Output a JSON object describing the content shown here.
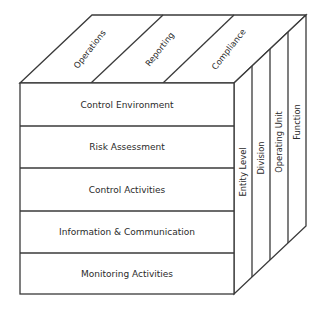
{
  "diagram": {
    "top_face": {
      "objectives": [
        {
          "label": "Operations"
        },
        {
          "label": "Reporting"
        },
        {
          "label": "Compliance"
        }
      ]
    },
    "front_face": {
      "components": [
        {
          "label": "Control Environment"
        },
        {
          "label": "Risk Assessment"
        },
        {
          "label": "Control Activities"
        },
        {
          "label": "Information & Communication"
        },
        {
          "label": "Monitoring Activities"
        }
      ]
    },
    "side_face": {
      "structure": [
        {
          "label": "Entity Level"
        },
        {
          "label": "Division"
        },
        {
          "label": "Operating Unit"
        },
        {
          "label": "Function"
        }
      ]
    },
    "colors": {
      "line": "#3a3a3a",
      "text": "#2a2a2a",
      "background": "#ffffff"
    }
  }
}
